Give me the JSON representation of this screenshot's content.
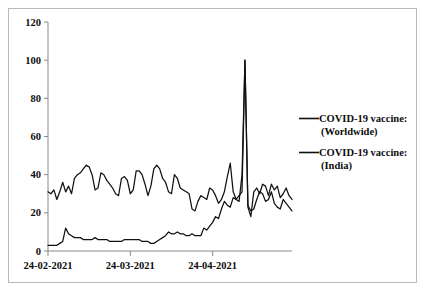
{
  "chart_data": {
    "type": "line",
    "title": "",
    "xlabel": "",
    "ylabel": "",
    "ylim": [
      0,
      120
    ],
    "yticks": [
      0,
      20,
      40,
      60,
      80,
      100,
      120
    ],
    "ytick_labels": [
      "0",
      "20",
      "40",
      "60",
      "80",
      "100",
      "120"
    ],
    "grid": false,
    "legend_position": "right",
    "xtick_labels": [
      "24-02-2021",
      "24-03-2021",
      "24-04-2021"
    ],
    "xtick_index": [
      0,
      28,
      56
    ],
    "x_count": 84,
    "series": [
      {
        "name": "COVID-19 vaccine: (Worldwide)",
        "color": "#111111",
        "values": [
          31,
          30,
          32,
          27,
          31,
          36,
          31,
          34,
          30,
          38,
          40,
          41,
          43,
          45,
          44,
          40,
          32,
          33,
          41,
          40,
          37,
          35,
          33,
          30,
          29,
          38,
          39,
          37,
          30,
          32,
          42,
          42,
          40,
          35,
          29,
          34,
          43,
          45,
          43,
          38,
          36,
          31,
          30,
          40,
          38,
          33,
          32,
          31,
          30,
          22,
          21,
          26,
          29,
          28,
          27,
          33,
          32,
          29,
          25,
          27,
          31,
          39,
          46,
          31,
          27,
          29,
          31,
          100,
          23,
          18,
          31,
          33,
          30,
          35,
          34,
          29,
          35,
          32,
          34,
          28,
          30,
          33,
          29,
          27
        ]
      },
      {
        "name": "COVID-19 vaccine: (India)",
        "color": "#111111",
        "values": [
          3,
          3,
          3,
          3,
          4,
          5,
          12,
          9,
          8,
          7,
          7,
          7,
          6,
          6,
          6,
          6,
          7,
          6,
          6,
          6,
          6,
          5,
          5,
          5,
          5,
          5,
          6,
          6,
          6,
          6,
          6,
          6,
          5,
          5,
          5,
          4,
          4,
          5,
          6,
          7,
          8,
          10,
          9,
          9,
          10,
          9,
          9,
          8,
          8,
          9,
          8,
          8,
          8,
          12,
          11,
          13,
          15,
          18,
          17,
          22,
          26,
          24,
          23,
          28,
          27,
          26,
          40,
          100,
          24,
          21,
          22,
          27,
          31,
          30,
          26,
          27,
          31,
          25,
          23,
          22,
          27,
          25,
          23,
          21
        ]
      }
    ],
    "legend": [
      {
        "label_line1": "COVID-19 vaccine:",
        "label_line2": "(Worldwide)"
      },
      {
        "label_line1": "COVID-19 vaccine:",
        "label_line2": "(India)"
      }
    ]
  }
}
